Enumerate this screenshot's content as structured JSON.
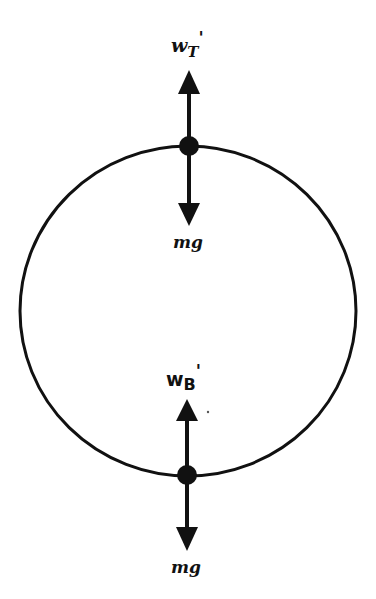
{
  "diagram": {
    "type": "free-body diagram",
    "colors": {
      "ink": "#111111",
      "background": "#ffffff"
    },
    "circle": {
      "cx": 188,
      "cy": 311,
      "rx": 168,
      "ry": 165
    },
    "points": [
      {
        "id": "top",
        "x": 189,
        "y": 146,
        "up_force": {
          "label_main": "w",
          "label_sub": "T",
          "label_prime": "'"
        },
        "down_force": {
          "label": "mg"
        }
      },
      {
        "id": "bottom",
        "x": 187,
        "y": 475,
        "up_force": {
          "label_main": "w",
          "label_sub": "B",
          "label_prime": "'"
        },
        "down_force": {
          "label": "mg"
        }
      }
    ]
  }
}
